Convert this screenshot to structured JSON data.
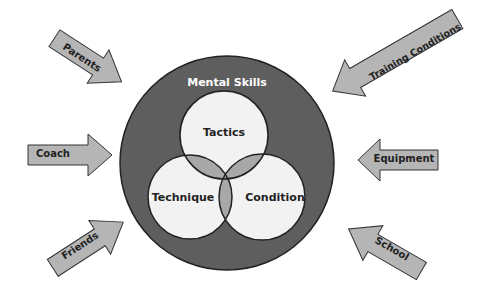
{
  "diagram": {
    "title": "Mental Skills",
    "core_circles": [
      {
        "id": "tactics",
        "label": "Tactics"
      },
      {
        "id": "technique",
        "label": "Technique"
      },
      {
        "id": "condition",
        "label": "Condition"
      }
    ],
    "influences": [
      {
        "id": "parents",
        "label": "Parents",
        "side": "left",
        "position": "top"
      },
      {
        "id": "coach",
        "label": "Coach",
        "side": "left",
        "position": "middle"
      },
      {
        "id": "friends",
        "label": "Friends",
        "side": "left",
        "position": "bottom"
      },
      {
        "id": "training-conditions",
        "label": "Training Conditions",
        "side": "right",
        "position": "top"
      },
      {
        "id": "equipment",
        "label": "Equipment",
        "side": "right",
        "position": "middle"
      },
      {
        "id": "school",
        "label": "School",
        "side": "right",
        "position": "bottom"
      }
    ],
    "colors": {
      "outer_circle": "#5e5e5e",
      "inner_circle": "#f2f2f2",
      "overlap": "#a8a8a8",
      "arrow_fill": "#b5b5b5",
      "stroke": "#222222",
      "title_text": "#ffffff"
    }
  }
}
